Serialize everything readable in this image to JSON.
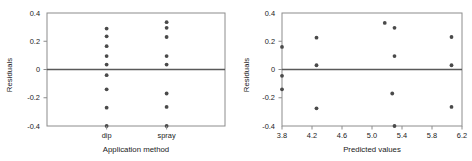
{
  "figure": {
    "background": "#ffffff",
    "dot_color": "#4a4a4a",
    "frame_color": "#8c8c8c",
    "zero_line_color": "#595959"
  },
  "chart_data": [
    {
      "type": "scatter",
      "panel": "left",
      "title": "",
      "xlabel": "Application method",
      "ylabel": "Residuals",
      "x_type": "categorical",
      "categories": [
        "dip",
        "spray"
      ],
      "xticklabels": [
        "dip",
        "spray"
      ],
      "yticklabels": [
        "0.4",
        "0.2",
        "0",
        "-0.2",
        "-0.4"
      ],
      "yticks": [
        0.4,
        0.2,
        0,
        -0.2,
        -0.4
      ],
      "ylim": [
        -0.4,
        0.4
      ],
      "grid": false,
      "legend": false,
      "zero_reference_line": 0,
      "series": [
        {
          "name": "dip",
          "category": "dip",
          "values": [
            0.29,
            0.235,
            0.165,
            0.095,
            0.035,
            -0.04,
            -0.14,
            -0.27,
            -0.4
          ]
        },
        {
          "name": "spray",
          "category": "spray",
          "values": [
            0.335,
            0.295,
            0.23,
            0.095,
            0.035,
            -0.17,
            -0.265,
            -0.4
          ]
        }
      ]
    },
    {
      "type": "scatter",
      "panel": "right",
      "title": "",
      "xlabel": "Predicted values",
      "ylabel": "Residuals",
      "x_type": "numeric",
      "xticklabels": [
        "3.8",
        "4.2",
        "4.6",
        "5.0",
        "5.4",
        "5.8",
        "6.2"
      ],
      "xticks": [
        3.8,
        4.2,
        4.6,
        5.0,
        5.4,
        5.8,
        6.2
      ],
      "xlim": [
        3.8,
        6.2
      ],
      "yticklabels": [
        "0.4",
        "0.2",
        "0",
        "-0.2",
        "-0.4"
      ],
      "yticks": [
        0.4,
        0.2,
        0,
        -0.2,
        -0.4
      ],
      "ylim": [
        -0.4,
        0.4
      ],
      "grid": false,
      "legend": false,
      "zero_reference_line": 0,
      "points": [
        {
          "x": 3.8,
          "y": 0.16
        },
        {
          "x": 3.8,
          "y": -0.045
        },
        {
          "x": 3.8,
          "y": -0.14
        },
        {
          "x": 4.26,
          "y": 0.225
        },
        {
          "x": 4.26,
          "y": 0.03
        },
        {
          "x": 4.26,
          "y": -0.275
        },
        {
          "x": 5.17,
          "y": 0.33
        },
        {
          "x": 5.3,
          "y": 0.295
        },
        {
          "x": 5.3,
          "y": 0.095
        },
        {
          "x": 5.27,
          "y": -0.17
        },
        {
          "x": 5.3,
          "y": -0.4
        },
        {
          "x": 6.06,
          "y": 0.23
        },
        {
          "x": 6.06,
          "y": 0.03
        },
        {
          "x": 6.06,
          "y": -0.265
        }
      ]
    }
  ]
}
